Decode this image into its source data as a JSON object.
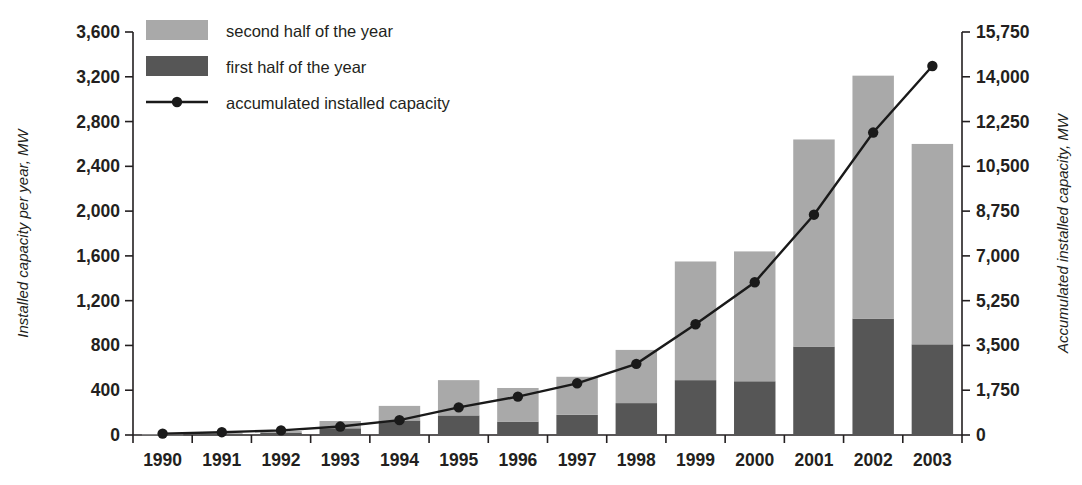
{
  "chart_data": {
    "type": "bar",
    "title": "",
    "subtitle": "",
    "categories": [
      "1990",
      "1991",
      "1992",
      "1993",
      "1994",
      "1995",
      "1996",
      "1997",
      "1998",
      "1999",
      "2000",
      "2001",
      "2002",
      "2003"
    ],
    "series": [
      {
        "name": "first half of the year",
        "axis": "left",
        "color": "#565656",
        "values": [
          3,
          10,
          18,
          60,
          130,
          175,
          120,
          180,
          285,
          490,
          480,
          790,
          1040,
          810
        ]
      },
      {
        "name": "second half of the year",
        "axis": "left",
        "color": "#a9a9a9",
        "values": [
          2,
          10,
          17,
          65,
          130,
          315,
          300,
          340,
          475,
          1060,
          1160,
          1850,
          2170,
          1790
        ]
      },
      {
        "name": "accumulated installed capacity",
        "axis": "right",
        "type": "line",
        "color": "#1a1a1a",
        "values": [
          55,
          110,
          180,
          330,
          580,
          1080,
          1500,
          2020,
          2780,
          4330,
          5970,
          8610,
          11820,
          14420
        ]
      }
    ],
    "totals_left_axis": [
      5,
      20,
      35,
      125,
      260,
      490,
      420,
      520,
      760,
      1550,
      1640,
      2640,
      3210,
      2600
    ],
    "stacked": true,
    "grid": false,
    "legend_position": "top-left",
    "xlabel": "",
    "left_axis": {
      "label": "Installed capacity per year, MW",
      "ticks": [
        "0",
        "400",
        "800",
        "1,200",
        "1,600",
        "2,000",
        "2,400",
        "2,800",
        "3,200",
        "3,600"
      ],
      "tick_values": [
        0,
        400,
        800,
        1200,
        1600,
        2000,
        2400,
        2800,
        3200,
        3600
      ],
      "ylim": [
        0,
        3600
      ]
    },
    "right_axis": {
      "label": "Accumulated installed capacity, MW",
      "ticks": [
        "0",
        "1,750",
        "3,500",
        "5,250",
        "7,000",
        "8,750",
        "10,500",
        "12,250",
        "14,000",
        "15,750"
      ],
      "tick_values": [
        0,
        1750,
        3500,
        5250,
        7000,
        8750,
        10500,
        12250,
        14000,
        15750
      ],
      "ylim": [
        0,
        15750
      ]
    },
    "legend": [
      {
        "label": "second half of the year",
        "marker": "swatch",
        "color": "#a9a9a9"
      },
      {
        "label": "first half of the year",
        "marker": "swatch",
        "color": "#565656"
      },
      {
        "label": "accumulated installed capacity",
        "marker": "line-point",
        "color": "#1a1a1a"
      }
    ]
  }
}
